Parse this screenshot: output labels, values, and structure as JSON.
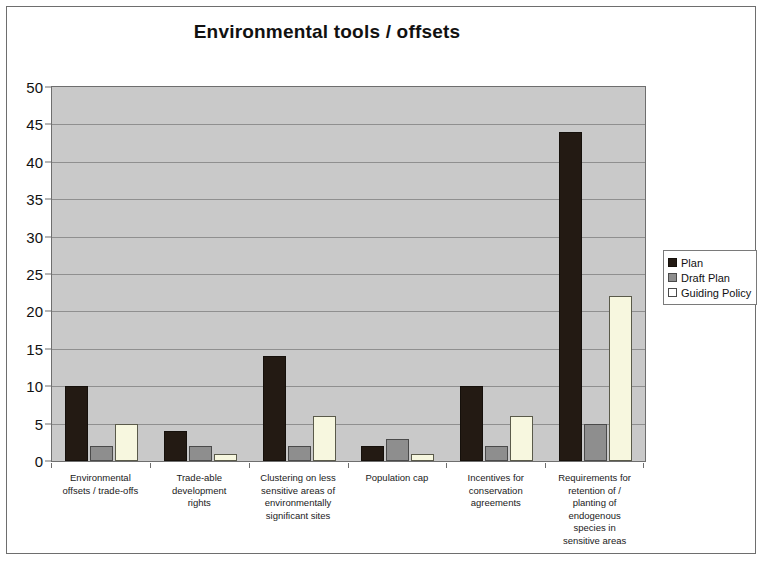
{
  "chart_data": {
    "type": "bar",
    "title": "Environmental tools / offsets",
    "xlabel": "",
    "ylabel": "",
    "ylim": [
      0,
      50
    ],
    "ytick_step": 5,
    "yticks": [
      50,
      45,
      40,
      35,
      30,
      25,
      20,
      15,
      10,
      5,
      0
    ],
    "grid": true,
    "legend_position": "right",
    "categories": [
      "Environmental offsets / trade-offs",
      "Trade-able development rights",
      "Clustering on less sensitive areas of environmentally significant sites",
      "Population cap",
      "Incentives for conservation agreements",
      "Requirements for retention of / planting of endogenous species in sensitive areas"
    ],
    "category_lines": [
      [
        "Environmental",
        "offsets / trade-offs"
      ],
      [
        "Trade-able",
        "development",
        "rights"
      ],
      [
        "Clustering on less",
        "sensitive areas of",
        "environmentally",
        "significant sites"
      ],
      [
        "Population cap"
      ],
      [
        "Incentives for",
        "conservation",
        "agreements"
      ],
      [
        "Requirements for",
        "retention of /",
        "planting of",
        "endogenous",
        "species in",
        "sensitive areas"
      ]
    ],
    "series": [
      {
        "name": "Plan",
        "color": "#231a13",
        "values": [
          10,
          4,
          14,
          2,
          10,
          44
        ]
      },
      {
        "name": "Draft Plan",
        "color": "#8e8e8e",
        "values": [
          2,
          2,
          2,
          3,
          2,
          5
        ]
      },
      {
        "name": "Guiding Policy",
        "color": "#f7f7df",
        "values": [
          5,
          1,
          6,
          1,
          6,
          22
        ]
      }
    ]
  },
  "legend": {
    "items": [
      {
        "label": "Plan",
        "swatch": "legend-swatch-plan"
      },
      {
        "label": "Draft Plan",
        "swatch": "legend-swatch-draft-plan"
      },
      {
        "label": "Guiding Policy",
        "swatch": "legend-swatch-guiding-policy"
      }
    ]
  }
}
